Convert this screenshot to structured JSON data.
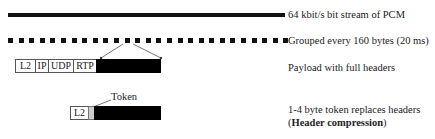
{
  "rows": {
    "stream": {
      "label": "64 kbit/s bit stream of PCM"
    },
    "grouped": {
      "label": "Grouped every 160 bytes (20 ms)",
      "dot_count": 27
    },
    "full_headers": {
      "label": "Payload with full headers",
      "headers": [
        "L2",
        "IP",
        "UDP",
        "RTP"
      ]
    },
    "compressed": {
      "label_line1": "1-4 byte token replaces headers",
      "label_line2_open": "(",
      "label_line2_bold": "Header compression",
      "label_line2_close": ")",
      "header": "L2",
      "token_label": "Token"
    }
  },
  "colors": {
    "payload": "#000000",
    "token": "#cccccc"
  }
}
